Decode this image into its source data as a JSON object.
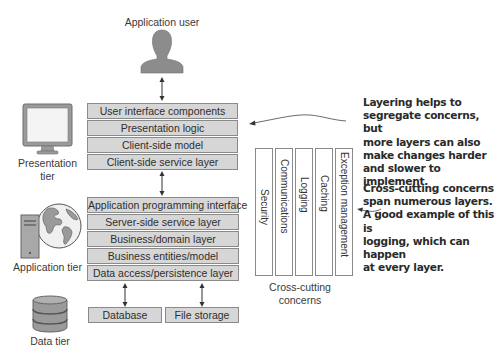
{
  "actor": {
    "label": "Application user",
    "icon": "person-silhouette-icon"
  },
  "tiers": [
    {
      "label_line1": "Presentation",
      "label_line2": "tier",
      "icon": "monitor-icon"
    },
    {
      "label": "Application tier",
      "icon": "server-globe-icon"
    },
    {
      "label": "Data tier",
      "icon": "database-cylinder-icon"
    }
  ],
  "presentation_layers": [
    "User interface components",
    "Presentation logic",
    "Client-side model",
    "Client-side service layer"
  ],
  "application_layers": [
    "Application programming interface",
    "Server-side service layer",
    "Business/domain layer",
    "Business entities/model",
    "Data access/persistence layer"
  ],
  "data_stores": [
    "Database",
    "File storage"
  ],
  "cross_cutting": {
    "columns": [
      "Security",
      "Communications",
      "Logging",
      "Caching",
      "Exception management"
    ],
    "label_line1": "Cross-cutting",
    "label_line2": "concerns"
  },
  "annotations": {
    "layering": [
      "Layering helps to",
      "segregate concerns, but",
      "more layers can also",
      "make changes harder",
      "and slower to implement."
    ],
    "cross_cutting": [
      "Cross-cutting concerns",
      "span numerous layers.",
      "A good example of this is",
      "logging, which can happen",
      "at every layer."
    ]
  },
  "colors": {
    "layer_fill": "#d6d6d6",
    "layer_border": "#8a8a8a",
    "icon_gray": "#8c8c8c",
    "text": "#2e2e2e"
  }
}
